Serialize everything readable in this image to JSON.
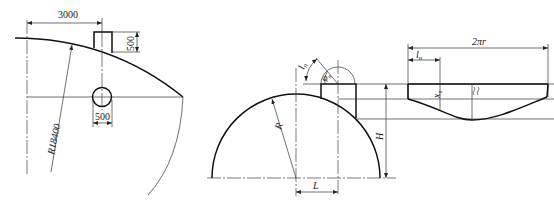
{
  "figure_left": {
    "dim_horizontal": "3000",
    "dim_box_height": "500",
    "dim_circle_diameter": "500",
    "radius_label": "R18400"
  },
  "figure_middle": {
    "label_radius": "R",
    "label_height": "H",
    "label_offset": "L",
    "label_arc_length": "l",
    "label_arc_length_sub": "n",
    "label_angle": "φ",
    "label_angle_sub": "n"
  },
  "figure_right": {
    "label_circumference": "2πr",
    "label_segment": "l",
    "label_segment_sub": "n",
    "label_ordinate": "x",
    "label_ordinate_sub": "n"
  }
}
